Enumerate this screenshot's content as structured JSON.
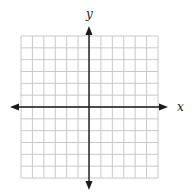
{
  "diagram": {
    "type": "coordinate-plane",
    "x_axis_label": "x",
    "y_axis_label": "y",
    "grid": {
      "columns": 12,
      "rows": 12,
      "left": 21,
      "top": 36,
      "right": 158,
      "bottom": 178
    },
    "origin": {
      "px": 89,
      "py": 107
    },
    "x_axis": {
      "from": 10,
      "to": 168
    },
    "y_axis": {
      "from": 26,
      "to": 190
    },
    "colors": {
      "grid": "#c8c8c8",
      "axis": "#1a1a1a",
      "background": "#ffffff"
    }
  }
}
